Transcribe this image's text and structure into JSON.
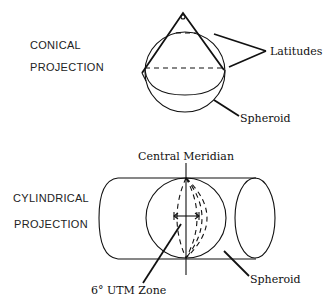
{
  "diagram": {
    "conical": {
      "title_line1": "CONICAL",
      "title_line2": "PROJECTION",
      "label_latitudes": "Latitudes",
      "label_spheroid": "Spheroid"
    },
    "cylindrical": {
      "title_line1": "CYLINDRICAL",
      "title_line2": "PROJECTION",
      "label_central_meridian": "Central Meridian",
      "label_utm_zone": "6° UTM Zone",
      "label_spheroid": "Spheroid"
    },
    "colors": {
      "line": "#111111",
      "background": "#ffffff"
    }
  }
}
